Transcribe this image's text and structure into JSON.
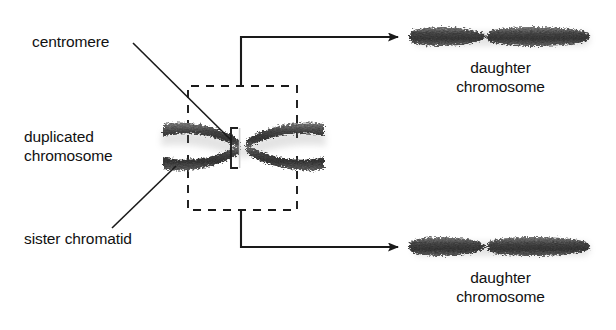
{
  "figure": {
    "background_color": "#ffffff",
    "ink_color": "#111111",
    "chromosome_color_dark": "#3a3a3a",
    "chromosome_color_mid": "#6a6a6a",
    "chromosome_color_light": "#9a9a9a"
  },
  "labels": {
    "centromere": "centromere",
    "duplicated_chromosome_line1": "duplicated",
    "duplicated_chromosome_line2": "chromosome",
    "sister_chromatid": "sister chromatid",
    "daughter_top_line1": "daughter",
    "daughter_top_line2": "chromosome",
    "daughter_bottom_line1": "daughter",
    "daughter_bottom_line2": "chromosome"
  },
  "icons": {
    "arrow_top": "arrow-right-icon",
    "arrow_bottom": "arrow-right-icon",
    "centromere_bracket": "bracket-icon",
    "dashed_box_top": "dashed-selection-box-icon",
    "dashed_box_bottom": "dashed-selection-box-icon"
  },
  "structures": {
    "duplicated_chromosome": {
      "name": "duplicated-chromosome",
      "shape": "X-shaped pair of sister chromatids joined at centromere",
      "center_x": 243,
      "center_y": 148,
      "chromatid_count": 2
    },
    "daughter_chromosome_top": {
      "name": "daughter-chromosome-top",
      "shape": "single chromosome with pinched centromere waist",
      "center_x": 500,
      "center_y": 38
    },
    "daughter_chromosome_bottom": {
      "name": "daughter-chromosome-bottom",
      "shape": "single chromosome with pinched centromere waist",
      "center_x": 500,
      "center_y": 248
    }
  }
}
